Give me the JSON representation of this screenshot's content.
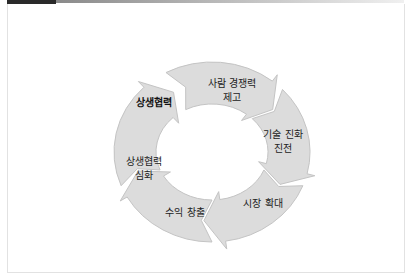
{
  "diagram": {
    "type": "cycle",
    "center_label": "상생협력",
    "colors": {
      "arrow_fill": "#dcdcdc",
      "arrow_stroke": "#c4c4c4",
      "text": "#222222"
    },
    "steps": [
      {
        "line1": "사람 경쟁력",
        "line2": "제고"
      },
      {
        "line1": "기술 진화",
        "line2": "진전"
      },
      {
        "line1": "시장 확대",
        "line2": ""
      },
      {
        "line1": "수익 창출",
        "line2": ""
      },
      {
        "line1": "상생협력",
        "line2": "심화"
      }
    ]
  }
}
